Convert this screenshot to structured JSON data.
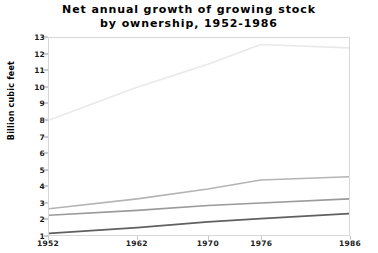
{
  "title": {
    "line1": "Net annual growth of growing stock",
    "line2": "by ownership, 1952-1986"
  },
  "axes": {
    "ylabel": "Billion cubic feet",
    "xlabel": "",
    "yticks": [
      "1",
      "2",
      "3",
      "4",
      "5",
      "6",
      "7",
      "8",
      "9",
      "10",
      "11",
      "12",
      "13"
    ],
    "xticks": [
      "1952",
      "1962",
      "1970",
      "1976",
      "1986"
    ]
  },
  "legend": {
    "entries": [
      "",
      "",
      "",
      ""
    ]
  },
  "chart_data": {
    "type": "line",
    "title": "Net annual growth of growing stock by ownership, 1952-1986",
    "xlabel": "",
    "ylabel": "Billion cubic feet",
    "x": [
      1952,
      1962,
      1970,
      1976,
      1986
    ],
    "xlim": [
      1952,
      1986
    ],
    "ylim": [
      1,
      13
    ],
    "grid": false,
    "legend_position": "right",
    "series": [
      {
        "name": "series-1",
        "color": "#e9e9e9",
        "values": [
          8.0,
          10.0,
          11.4,
          12.6,
          12.4
        ]
      },
      {
        "name": "series-2",
        "color": "#b4b4b4",
        "values": [
          2.6,
          3.2,
          3.8,
          4.35,
          4.55
        ]
      },
      {
        "name": "series-3",
        "color": "#9a9a9a",
        "values": [
          2.2,
          2.5,
          2.8,
          2.95,
          3.2
        ]
      },
      {
        "name": "series-4",
        "color": "#606060",
        "values": [
          1.1,
          1.45,
          1.8,
          2.0,
          2.3
        ]
      }
    ]
  }
}
